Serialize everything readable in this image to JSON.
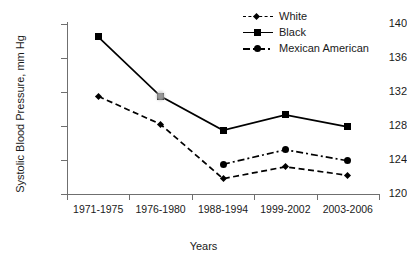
{
  "chart_data": {
    "type": "line",
    "title": "",
    "xlabel": "Years",
    "ylabel": "Systolic Blood Pressure, mm Hg",
    "categories": [
      "1971-1975",
      "1976-1980",
      "1988-1994",
      "1999-2002",
      "2003-2006"
    ],
    "ylim": [
      120,
      140
    ],
    "yticks": [
      120,
      124,
      128,
      132,
      136,
      140
    ],
    "grid": false,
    "legend_position": "top-right",
    "series": [
      {
        "name": "White",
        "marker": "diamond",
        "line_style": "dashed",
        "color": "#000000",
        "values": [
          131.5,
          128.2,
          121.8,
          123.2,
          122.2
        ]
      },
      {
        "name": "Black",
        "marker": "square",
        "line_style": "solid",
        "color": "#000000",
        "values": [
          138.5,
          131.5,
          127.5,
          129.3,
          127.9
        ]
      },
      {
        "name": "Mexican American",
        "marker": "circle",
        "line_style": "dash-dot",
        "color": "#000000",
        "values": [
          null,
          null,
          123.5,
          125.2,
          123.9
        ]
      }
    ],
    "annotations": [
      {
        "name": "grey-smudge-artifact",
        "x_category": "1976-1980",
        "y_value": 131.5
      }
    ]
  }
}
